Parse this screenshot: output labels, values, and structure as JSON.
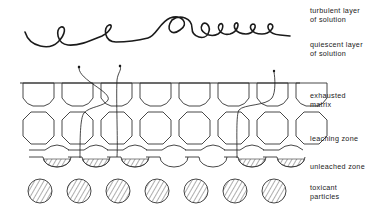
{
  "diagram": {
    "type": "schematic cross-section",
    "colors": {
      "ink": "#1a1a1a",
      "background": "#ffffff"
    },
    "labels": [
      {
        "id": "turbulent",
        "text": "turbulent layer\nof solution"
      },
      {
        "id": "quiescent",
        "text": "quiescent layer\nof solution"
      },
      {
        "id": "exhausted",
        "text": "exhausted\nmatrix"
      },
      {
        "id": "leaching",
        "text": "leaching zone"
      },
      {
        "id": "unleached",
        "text": "unleached zone"
      },
      {
        "id": "toxicant",
        "text": "toxicant\nparticles"
      }
    ],
    "matrix_columns": 7,
    "toxicant_particle_count": 7,
    "diffusion_path_count": 3
  }
}
